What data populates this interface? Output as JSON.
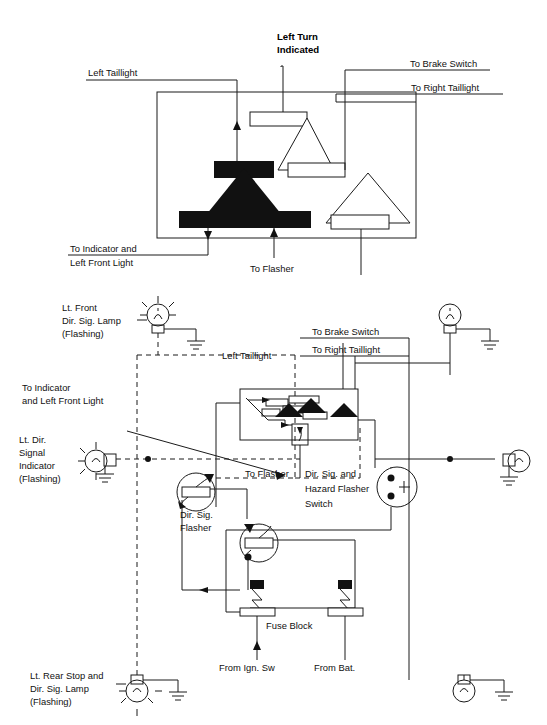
{
  "document": {
    "title": "Directional Signal and Hazard Flasher Wiring Diagram",
    "ink_color": "#111111",
    "background_color": "#ffffff"
  },
  "top_detail": {
    "caption_labels": {
      "left_turn_indicated": "Left Turn\nIndicated",
      "left_turn_indicated_line1": "Left Turn",
      "left_turn_indicated_line2": "Indicated",
      "left_taillight": "Left Taillight",
      "to_brake_switch": "To Brake Switch",
      "to_right_taillight": "To Right Taillight",
      "to_indicator_line1": "To Indicator and",
      "to_indicator_line2": "Left Front Light",
      "to_flasher": "To Flasher"
    }
  },
  "schematic": {
    "labels": {
      "lt_front_lamp_line1": "Lt. Front",
      "lt_front_lamp_line2": "Dir. Sig. Lamp",
      "lt_front_lamp_line3": "(Flashing)",
      "to_indicator_line1": "To Indicator",
      "to_indicator_line2": "and Left Front Light",
      "lt_dir_indicator_line1": "Lt. Dir.",
      "lt_dir_indicator_line2": "Signal",
      "lt_dir_indicator_line3": "Indicator",
      "lt_dir_indicator_line4": "(Flashing)",
      "left_taillight": "Left Taillight",
      "to_brake_switch": "To Brake Switch",
      "to_right_taillight": "To Right Taillight",
      "to_flasher": "To Flasher",
      "dir_sig_hazard_line1": "Dir. Sig. and",
      "dir_sig_hazard_line2": "Hazard Flasher",
      "dir_sig_hazard_line3": "Switch",
      "dir_sig_flasher_line1": "Dir. Sig.",
      "dir_sig_flasher_line2": "Flasher",
      "fuse_block": "Fuse Block",
      "from_ign_sw": "From Ign. Sw",
      "from_bat": "From Bat.",
      "lt_rear_lamp_line1": "Lt. Rear Stop and",
      "lt_rear_lamp_line2": "Dir. Sig. Lamp",
      "lt_rear_lamp_line3": "(Flashing)"
    },
    "components": [
      {
        "name": "lt-front-dir-sig-lamp",
        "type": "lamp",
        "flashing": true
      },
      {
        "name": "rt-front-dir-sig-lamp",
        "type": "lamp",
        "flashing": false
      },
      {
        "name": "lt-dir-signal-indicator",
        "type": "indicator",
        "flashing": true
      },
      {
        "name": "rt-dir-signal-indicator",
        "type": "indicator",
        "flashing": false
      },
      {
        "name": "dir-sig-and-hazard-flasher-switch",
        "type": "switch"
      },
      {
        "name": "dir-sig-flasher",
        "type": "flasher"
      },
      {
        "name": "hazard-flasher",
        "type": "flasher"
      },
      {
        "name": "hazard-switch-connector",
        "type": "connector"
      },
      {
        "name": "fuse-block",
        "type": "fuse-block",
        "fuse_count": 2
      },
      {
        "name": "lt-rear-stop-dir-sig-lamp",
        "type": "lamp",
        "flashing": true
      },
      {
        "name": "rt-rear-stop-dir-sig-lamp",
        "type": "lamp",
        "flashing": false
      }
    ]
  }
}
